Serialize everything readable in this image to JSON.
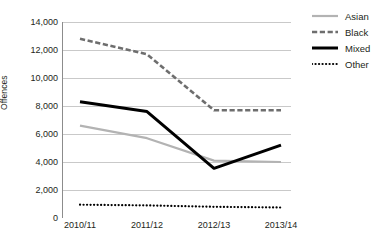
{
  "chart_data": {
    "type": "line",
    "title": "",
    "subtitle": "",
    "xlabel": "",
    "ylabel": "Offences",
    "categories": [
      "2010/11",
      "2011/12",
      "2012/13",
      "2013/14"
    ],
    "ylim": [
      0,
      14000
    ],
    "ytick_step": 2000,
    "ytick_labels": [
      "14,000",
      "12,000",
      "10,000",
      "8,000",
      "6,000",
      "4,000",
      "2,000",
      "0"
    ],
    "ytick_values": [
      14000,
      12000,
      10000,
      8000,
      6000,
      4000,
      2000,
      0
    ],
    "grid": "horizontal",
    "legend_position": "right",
    "series": [
      {
        "name": "Asian",
        "values": [
          6600,
          5700,
          4100,
          4000
        ],
        "color": "#b3b3b3",
        "style": "solid",
        "width": 2.2
      },
      {
        "name": "Black",
        "values": [
          12800,
          11700,
          7700,
          7700
        ],
        "color": "#6e6e6e",
        "style": "dashed",
        "width": 2.6
      },
      {
        "name": "Mixed",
        "values": [
          8300,
          7600,
          3550,
          5200
        ],
        "color": "#000000",
        "style": "solid",
        "width": 3.0
      },
      {
        "name": "Other",
        "values": [
          950,
          900,
          800,
          750
        ],
        "color": "#000000",
        "style": "dotted",
        "width": 2.2
      }
    ]
  },
  "axis": {
    "y_title": "Offences"
  },
  "caption": {
    "text": ""
  },
  "colors": {
    "grid": "#c9c9c9",
    "axis": "#8c8c8c",
    "text": "#231f20",
    "background": "#ffffff"
  }
}
